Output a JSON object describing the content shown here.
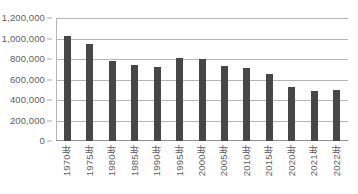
{
  "chart_data": {
    "type": "bar",
    "title": "",
    "xlabel": "",
    "ylabel": "",
    "grid": true,
    "legend": false,
    "ylim": [
      0,
      1200000
    ],
    "ytick_values": [
      0,
      200000,
      400000,
      600000,
      800000,
      1000000,
      1200000
    ],
    "ytick_labels": [
      "0",
      "200,000",
      "400,000",
      "600,000",
      "800,000",
      "1,000,000",
      "1,200,000"
    ],
    "categories": [
      "1970年",
      "1975年",
      "1980年",
      "1985年",
      "1990年",
      "1995年",
      "2000年",
      "2005年",
      "2010年",
      "2015年",
      "2020年",
      "2021年",
      "2022年"
    ],
    "values": [
      1020000,
      945000,
      780000,
      740000,
      725000,
      810000,
      805000,
      730000,
      710000,
      650000,
      530000,
      490000,
      500000
    ],
    "bar_color": "#474747",
    "gridline_color": "#b6b6b6",
    "axis_text_color": "#5e5e5e"
  }
}
